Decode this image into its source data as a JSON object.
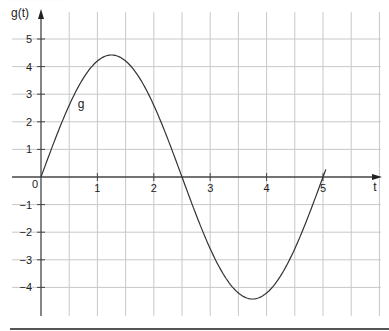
{
  "chart_data": {
    "type": "line",
    "title": "",
    "xlabel": "t",
    "ylabel": "g(t)",
    "xlim": [
      0,
      6.1
    ],
    "ylim": [
      -4.9,
      5.7
    ],
    "grid": true,
    "x_grid_step": 0.5,
    "y_grid_step": 1,
    "x_ticks": [
      {
        "value": 0,
        "label": "0"
      },
      {
        "value": 1,
        "label": "1"
      },
      {
        "value": 2,
        "label": "2"
      },
      {
        "value": 3,
        "label": "3"
      },
      {
        "value": 4,
        "label": "4"
      },
      {
        "value": 5,
        "label": "5"
      }
    ],
    "y_ticks": [
      {
        "value": 5,
        "label": "5"
      },
      {
        "value": 4,
        "label": "4"
      },
      {
        "value": 3,
        "label": "3"
      },
      {
        "value": 2,
        "label": "2"
      },
      {
        "value": 1,
        "label": "1"
      },
      {
        "value": -1,
        "label": "−1"
      },
      {
        "value": -2,
        "label": "−2"
      },
      {
        "value": -3,
        "label": "−3"
      },
      {
        "value": -4,
        "label": "−4"
      }
    ],
    "series": [
      {
        "name": "g",
        "label": "g",
        "label_position": {
          "t": 0.65,
          "g": 2.65
        },
        "color": "#333333",
        "x": [
          0,
          0.25,
          0.5,
          0.75,
          1.0,
          1.25,
          1.5,
          1.75,
          2.0,
          2.25,
          2.5,
          2.75,
          3.0,
          3.25,
          3.5,
          3.75,
          4.0,
          4.25,
          4.5,
          4.75,
          5.0,
          5.05
        ],
        "y": [
          0,
          1.37,
          2.6,
          3.58,
          4.2,
          4.42,
          4.2,
          3.58,
          2.6,
          1.37,
          0,
          -1.37,
          -2.6,
          -3.58,
          -4.2,
          -4.42,
          -4.2,
          -3.58,
          -2.6,
          -1.37,
          0,
          0.28
        ]
      }
    ],
    "extrema": {
      "max": {
        "t": 1.25,
        "g": 4.42
      },
      "min": {
        "t": 3.75,
        "g": -4.42
      }
    },
    "zero_crossings": [
      0,
      2.5,
      5
    ]
  }
}
